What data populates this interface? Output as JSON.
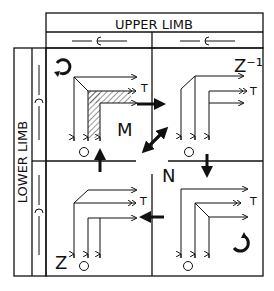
{
  "header": {
    "title": "UPPER LIMB"
  },
  "side": {
    "title": "LOWER LIMB"
  },
  "quadrants": {
    "top_left": {
      "label": "M",
      "terminal": "T",
      "origin": "O"
    },
    "top_right": {
      "label": "Z⁻¹",
      "terminal": "T",
      "origin": "O"
    },
    "bottom_left": {
      "label": "Z",
      "terminal": "T",
      "origin": "O"
    },
    "bottom_right": {
      "label": "",
      "terminal": "T",
      "origin": "O"
    }
  },
  "center": {
    "label": "N"
  },
  "icons": {
    "rotate_ccw": "counterclockwise-arrow",
    "rotate_cw": "clockwise-arrow",
    "joint": "C-joint-symbol"
  },
  "colors": {
    "ink": "#111111",
    "background": "#ffffff",
    "hatch": "#333333"
  }
}
